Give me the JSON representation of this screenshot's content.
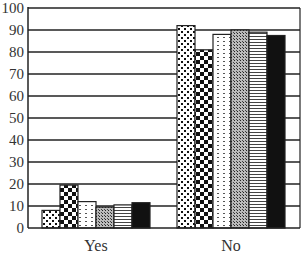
{
  "chart_data": {
    "type": "bar",
    "title": "",
    "xlabel": "",
    "ylabel": "",
    "ylim": [
      0,
      100
    ],
    "yticks": [
      0,
      10,
      20,
      30,
      40,
      50,
      60,
      70,
      80,
      90,
      100
    ],
    "grid": true,
    "legend": null,
    "categories": [
      "Yes",
      "No"
    ],
    "series": [
      {
        "name": "Series 1",
        "pattern": "dots",
        "values": [
          8,
          92
        ]
      },
      {
        "name": "Series 2",
        "pattern": "checkerboard",
        "values": [
          19.5,
          81
        ]
      },
      {
        "name": "Series 3",
        "pattern": "dashes",
        "values": [
          12,
          88
        ]
      },
      {
        "name": "Series 4",
        "pattern": "crosshatch",
        "values": [
          9.5,
          90
        ]
      },
      {
        "name": "Series 5",
        "pattern": "horizontal-stripes",
        "values": [
          10.5,
          89
        ]
      },
      {
        "name": "Series 6",
        "pattern": "solid-black",
        "values": [
          11.5,
          87.5
        ]
      }
    ]
  }
}
